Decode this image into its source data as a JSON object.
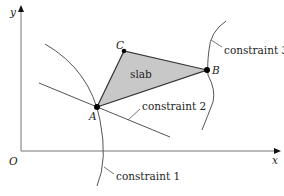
{
  "diagram": {
    "axes": {
      "x_label": "x",
      "y_label": "y",
      "origin_label": "O"
    },
    "points": [
      {
        "id": "A",
        "label": "A"
      },
      {
        "id": "B",
        "label": "B"
      },
      {
        "id": "C",
        "label": "C"
      }
    ],
    "region_label": "slab",
    "constraints": [
      {
        "id": "c1",
        "label": "constraint 1"
      },
      {
        "id": "c2",
        "label": "constraint 2"
      },
      {
        "id": "c3",
        "label": "constraint 3"
      }
    ],
    "colors": {
      "line": "#555555",
      "fill": "#c8c8c8",
      "point": "#000000",
      "text": "#222222"
    }
  }
}
